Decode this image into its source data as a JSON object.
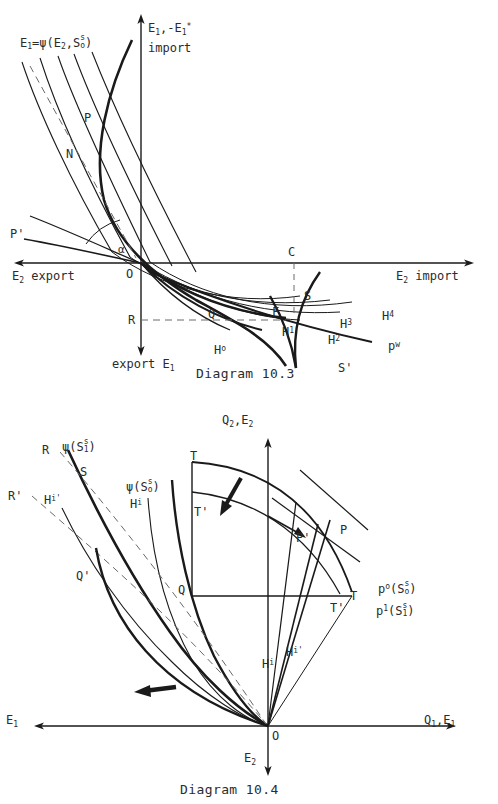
{
  "page": {
    "kind": "economics-textbook-figure-plate",
    "width": 498,
    "height": 804,
    "background": "#ffffff",
    "ink": "#1a1a1a"
  },
  "figures": [
    {
      "id": "diagram-10-3",
      "caption": "Diagram 10.3",
      "type": "four-quadrant-offer-curve-diagram",
      "axes": {
        "vertical_up_label": "E1,-E1*",
        "vertical_up_sublabel": "import",
        "vertical_down_label": "export E1",
        "horizontal_left_label": "E2 export",
        "horizontal_right_label": "E2 import",
        "origin_label": "O"
      },
      "annotations": [
        {
          "name": "psi-family-label",
          "text": "E1=ψ(E2,S0s)"
        },
        {
          "name": "point-P",
          "text": "P"
        },
        {
          "name": "point-N",
          "text": "N"
        },
        {
          "name": "point-P-prime",
          "text": "P'"
        },
        {
          "name": "point-R",
          "text": "R"
        },
        {
          "name": "point-C",
          "text": "C"
        },
        {
          "name": "point-Q",
          "text": "Q"
        },
        {
          "name": "point-F",
          "text": "F"
        },
        {
          "name": "point-S",
          "text": "S"
        },
        {
          "name": "point-S-prime",
          "text": "S'"
        },
        {
          "name": "curve-H0",
          "text": "H0"
        },
        {
          "name": "curve-H1",
          "text": "H1"
        },
        {
          "name": "curve-H2",
          "text": "H2"
        },
        {
          "name": "curve-H3",
          "text": "H3"
        },
        {
          "name": "curve-H4",
          "text": "H4"
        },
        {
          "name": "price-line-pw",
          "text": "pw"
        },
        {
          "name": "angle-alpha",
          "text": "α"
        }
      ]
    },
    {
      "id": "diagram-10-4",
      "caption": "Diagram 10.4",
      "type": "transformation-curve-diagram",
      "axes": {
        "vertical_up_label": "Q2,E2",
        "vertical_down_label": "E2",
        "horizontal_right_label": "Q1,E1",
        "horizontal_left_label": "E1",
        "origin_label": "O"
      },
      "annotations": [
        {
          "name": "psi-S1-label",
          "text": "ψ(S1s)"
        },
        {
          "name": "psi-S0-label",
          "text": "ψ(S0s)"
        },
        {
          "name": "point-R",
          "text": "R"
        },
        {
          "name": "point-R-prime",
          "text": "R'"
        },
        {
          "name": "point-S",
          "text": "S"
        },
        {
          "name": "curve-Hi",
          "text": "Hi"
        },
        {
          "name": "curve-Hi-prime",
          "text": "Hi'"
        },
        {
          "name": "curve-Hi-lower",
          "text": "Hi"
        },
        {
          "name": "curve-Hi-prime-lower",
          "text": "Hi'"
        },
        {
          "name": "point-Q",
          "text": "Q"
        },
        {
          "name": "point-Q-prime",
          "text": "Q'"
        },
        {
          "name": "point-T",
          "text": "T"
        },
        {
          "name": "point-T-prime",
          "text": "T'"
        },
        {
          "name": "point-T-lower",
          "text": "T"
        },
        {
          "name": "point-T-prime-lower",
          "text": "T'"
        },
        {
          "name": "point-P",
          "text": "P"
        },
        {
          "name": "point-P-prime",
          "text": "P'"
        },
        {
          "name": "price-p0",
          "text": "p0(S0s)"
        },
        {
          "name": "price-p1",
          "text": "p1(S1s)"
        }
      ]
    }
  ],
  "labels": {
    "d3": {
      "psi_family": {
        "head": "E",
        "head_sub": "1",
        "eq": "=ψ(E",
        "mid_sub": "2",
        "comma": ",S",
        "sup": "s",
        "subo": "o",
        "close": ")"
      },
      "axis_up_1": "E",
      "axis_up_1_sub": "1",
      "axis_up_2": ",-E",
      "axis_up_2_sub": "1",
      "axis_up_star": "*",
      "axis_up_word": "import",
      "axis_down_word": "export E",
      "axis_down_sub": "1",
      "axis_left": "E",
      "axis_left_sub": "2",
      "axis_left_word": "export",
      "axis_right": "E",
      "axis_right_sub": "2",
      "axis_right_word": "import",
      "O": "O",
      "P": "P",
      "N": "N",
      "Pprime": "P'",
      "R": "R",
      "C": "C",
      "Q": "Q",
      "F": "F",
      "S": "S",
      "Sprime": "S'",
      "alpha": "α",
      "H": "H",
      "h0": "o",
      "h1": "1",
      "h2": "2",
      "h3": "3",
      "h4": "4",
      "p": "p",
      "pw": "w",
      "caption": "Diagram 10.3"
    },
    "d4": {
      "axis_up": "Q",
      "axis_up_sub": "2",
      "axis_up_2": ",E",
      "axis_up_2_sub": "2",
      "axis_down": "E",
      "axis_down_sub": "2",
      "axis_right": "Q",
      "axis_right_sub": "1",
      "axis_right_2": ",E",
      "axis_right_2_sub": "1",
      "axis_left": "E",
      "axis_left_sub": "1",
      "psi": "ψ(S",
      "psi_close": ")",
      "s": "s",
      "one": "1",
      "zero": "o",
      "O": "O",
      "R": "R",
      "Rprime": "R'",
      "S": "S",
      "H": "H",
      "i": "i",
      "iprime": "i'",
      "Q": "Q",
      "Qprime": "Q'",
      "T": "T",
      "Tprime": "T'",
      "P": "P",
      "Pprime": "P'",
      "p": "p",
      "p0": "o",
      "p1": "1",
      "caption": "Diagram 10.4"
    }
  }
}
